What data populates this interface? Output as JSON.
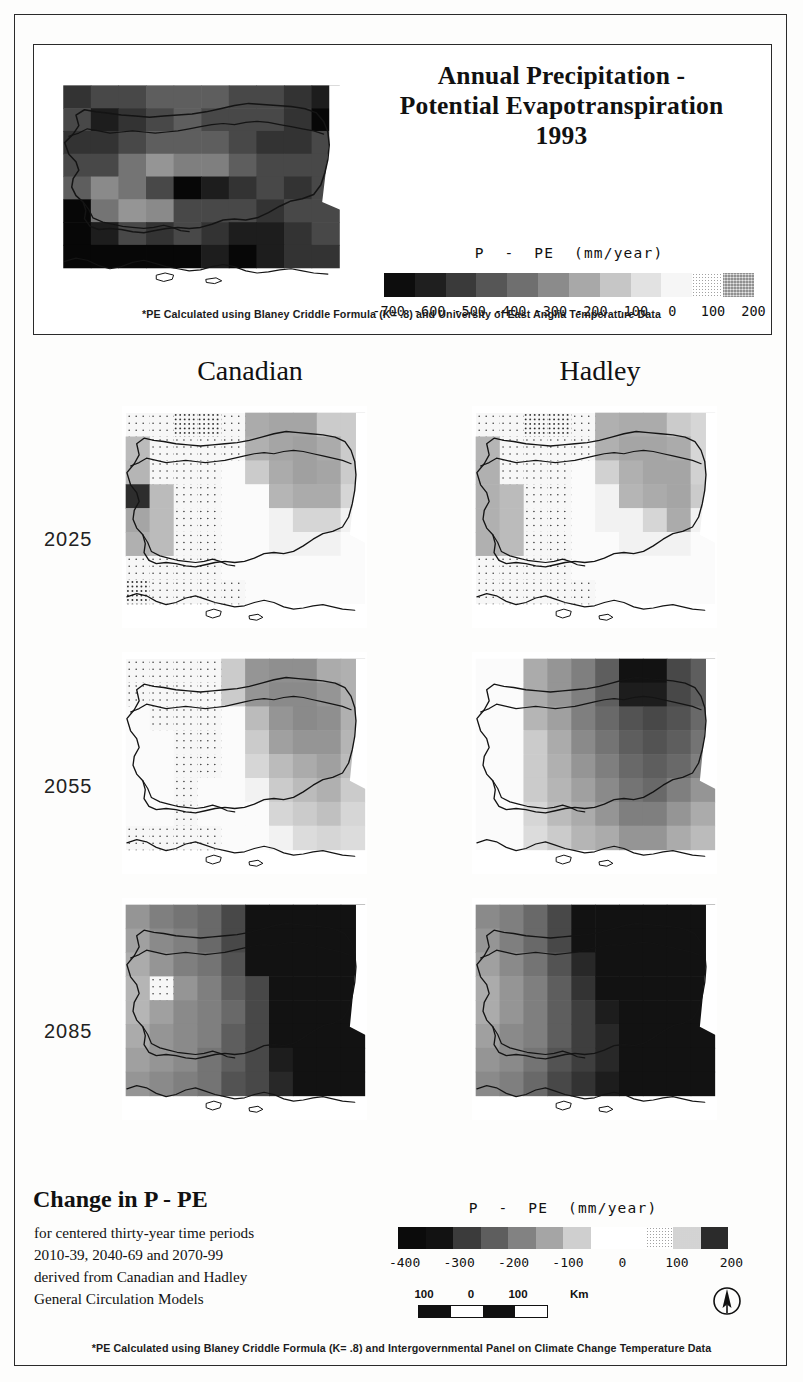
{
  "figure": {
    "title_lines": [
      "Annual Precipitation -",
      "Potential Evapotranspiration",
      "1993"
    ],
    "top_note": "*PE Calculated using Blaney Criddle Formula (K= .8) and University of East Anglia Temperature Data",
    "bottom_note": "*PE Calculated using Blaney Criddle Formula (K= .8) and Intergovernmental Panel on Climate Change Temperature Data",
    "region": "Bulgaria"
  },
  "legend_top": {
    "caption": "P  -  PE  (mm/year)",
    "ticks": [
      "-700",
      "-600",
      "-500",
      "-400",
      "-300",
      "-200",
      "-100",
      "0",
      "100",
      "200"
    ],
    "swatches": [
      "#0d0d0d",
      "#1f1f1f",
      "#3a3a3a",
      "#565656",
      "#6f6f6f",
      "#8b8b8b",
      "#a8a8a8",
      "#c6c6c6",
      "#e2e2e2",
      "#f6f6f6",
      "stipple-light",
      "stipple-dark"
    ]
  },
  "legend_bottom": {
    "caption": "P  -  PE  (mm/year)",
    "ticks": [
      "-400",
      "-300",
      "-200",
      "-100",
      "0",
      "100",
      "200"
    ],
    "swatches": [
      "#0b0b0b",
      "#121212",
      "#3b3b3b",
      "#5e5e5e",
      "#828282",
      "#a5a5a5",
      "#cfcfcf",
      "#ffffff",
      "#ffffff",
      "stipple-light",
      "stipple-mid",
      "#2b2b2b"
    ]
  },
  "matrix": {
    "columns": [
      "Canadian",
      "Hadley"
    ],
    "rows": [
      "2025",
      "2055",
      "2085"
    ]
  },
  "change_block": {
    "title": "Change in P - PE",
    "lines": [
      "for centered thirty-year time periods",
      "2010-39, 2040-69 and 2070-99",
      "derived from Canadian and Hadley",
      "General Circulation Models"
    ]
  },
  "scalebar": {
    "labels": [
      "100",
      "0",
      "100"
    ],
    "unit": "Km"
  },
  "chart_data": {
    "type": "heatmap",
    "variable": "P - PE",
    "units": "mm/year",
    "grid": {
      "cols": 10,
      "rows": 8
    },
    "panels": [
      {
        "name": "observed-1993",
        "label": "1993",
        "colorscale_ticks": [
          -700,
          -600,
          -500,
          -400,
          -300,
          -200,
          -100,
          0,
          100,
          200
        ],
        "values": [
          [
            -340,
            -300,
            -300,
            -260,
            -260,
            -260,
            -300,
            -300,
            -340,
            -380
          ],
          [
            -300,
            -380,
            -340,
            -300,
            -260,
            -300,
            -300,
            -300,
            -340,
            -420
          ],
          [
            -340,
            -340,
            -300,
            -260,
            -260,
            -260,
            -300,
            -340,
            -340,
            -300
          ],
          [
            -300,
            -300,
            -220,
            -160,
            -200,
            -200,
            -260,
            -300,
            -300,
            -300
          ],
          [
            -260,
            -180,
            -220,
            -300,
            -420,
            -380,
            -340,
            -300,
            -340,
            -300
          ],
          [
            -420,
            -220,
            -160,
            -180,
            -300,
            -300,
            -300,
            -340,
            -300,
            -300
          ],
          [
            -620,
            -380,
            -300,
            -340,
            -300,
            -340,
            -380,
            -380,
            -340,
            -300
          ],
          [
            -700,
            -620,
            -420,
            -660,
            -420,
            -380,
            -420,
            -380,
            -340,
            -340
          ]
        ]
      },
      {
        "name": "canadian-2025",
        "model": "Canadian",
        "period": "2010-39",
        "colorscale_ticks": [
          -400,
          -300,
          -200,
          -100,
          0,
          100,
          200
        ],
        "values": [
          [
            100,
            120,
            130,
            130,
            120,
            -120,
            -130,
            -130,
            -60,
            -60
          ],
          [
            -90,
            100,
            120,
            120,
            100,
            -110,
            -130,
            -140,
            -120,
            -60
          ],
          [
            -100,
            100,
            120,
            110,
            60,
            -60,
            -120,
            -140,
            -130,
            -60
          ],
          [
            -350,
            -90,
            110,
            100,
            60,
            30,
            -100,
            -120,
            -120,
            -40
          ],
          [
            -130,
            -90,
            110,
            100,
            60,
            30,
            20,
            -40,
            -40,
            20
          ],
          [
            -110,
            -90,
            110,
            100,
            60,
            30,
            20,
            20,
            20,
            30
          ],
          [
            120,
            110,
            120,
            110,
            60,
            40,
            30,
            30,
            40,
            40
          ],
          [
            130,
            120,
            120,
            110,
            80,
            60,
            40,
            40,
            40,
            40
          ]
        ]
      },
      {
        "name": "hadley-2025",
        "model": "Hadley",
        "period": "2010-39",
        "colorscale_ticks": [
          -400,
          -300,
          -200,
          -100,
          0,
          100,
          200
        ],
        "values": [
          [
            110,
            120,
            130,
            130,
            120,
            -110,
            -120,
            -120,
            -60,
            -40
          ],
          [
            -100,
            110,
            120,
            120,
            110,
            -110,
            -130,
            -130,
            -120,
            -40
          ],
          [
            -110,
            110,
            120,
            110,
            70,
            -50,
            -110,
            -130,
            -130,
            -50
          ],
          [
            -110,
            -90,
            110,
            100,
            60,
            20,
            -100,
            -120,
            -130,
            -60
          ],
          [
            -110,
            -90,
            110,
            100,
            60,
            20,
            20,
            -40,
            -120,
            20
          ],
          [
            -110,
            -90,
            110,
            100,
            60,
            30,
            20,
            20,
            20,
            30
          ],
          [
            110,
            110,
            120,
            110,
            60,
            40,
            30,
            30,
            40,
            40
          ],
          [
            120,
            120,
            120,
            110,
            80,
            60,
            40,
            40,
            40,
            40
          ]
        ]
      },
      {
        "name": "canadian-2055",
        "model": "Canadian",
        "period": "2040-69",
        "colorscale_ticks": [
          -400,
          -300,
          -200,
          -100,
          0,
          100,
          200
        ],
        "values": [
          [
            100,
            110,
            120,
            120,
            -60,
            -160,
            -170,
            -170,
            -120,
            -110
          ],
          [
            90,
            100,
            110,
            110,
            -60,
            -160,
            -180,
            -180,
            -160,
            -110
          ],
          [
            60,
            90,
            110,
            100,
            30,
            -90,
            -160,
            -180,
            -170,
            -110
          ],
          [
            40,
            60,
            100,
            90,
            30,
            -60,
            -140,
            -160,
            -160,
            -100
          ],
          [
            40,
            60,
            90,
            80,
            30,
            -40,
            -90,
            -120,
            -140,
            -90
          ],
          [
            40,
            60,
            80,
            70,
            30,
            20,
            -60,
            -90,
            -110,
            -60
          ],
          [
            60,
            70,
            80,
            70,
            40,
            30,
            -40,
            -60,
            -80,
            -40
          ],
          [
            80,
            80,
            90,
            80,
            50,
            40,
            20,
            -30,
            -40,
            -30
          ]
        ]
      },
      {
        "name": "hadley-2055",
        "model": "Hadley",
        "period": "2040-69",
        "colorscale_ticks": [
          -400,
          -300,
          -200,
          -100,
          0,
          100,
          200
        ],
        "values": [
          [
            60,
            60,
            -120,
            -160,
            -200,
            -260,
            -400,
            -400,
            -300,
            -260
          ],
          [
            40,
            40,
            -120,
            -160,
            -200,
            -260,
            -380,
            -380,
            -300,
            -260
          ],
          [
            40,
            40,
            -100,
            -140,
            -200,
            -240,
            -280,
            -300,
            -280,
            -240
          ],
          [
            40,
            40,
            -60,
            -120,
            -180,
            -220,
            -260,
            -280,
            -260,
            -220
          ],
          [
            40,
            40,
            -60,
            -110,
            -160,
            -200,
            -240,
            -260,
            -240,
            -200
          ],
          [
            40,
            30,
            -60,
            -100,
            -140,
            -180,
            -220,
            -240,
            -200,
            -160
          ],
          [
            30,
            30,
            -40,
            -90,
            -120,
            -160,
            -200,
            -200,
            -160,
            -120
          ],
          [
            30,
            30,
            -30,
            -60,
            -100,
            -120,
            -160,
            -160,
            -120,
            -90
          ]
        ]
      },
      {
        "name": "canadian-2085",
        "model": "Canadian",
        "period": "2070-99",
        "colorscale_ticks": [
          -400,
          -300,
          -200,
          -100,
          0,
          100,
          200
        ],
        "values": [
          [
            -160,
            -200,
            -220,
            -240,
            -300,
            -400,
            -400,
            -400,
            -400,
            -400
          ],
          [
            -140,
            -180,
            -200,
            -240,
            -300,
            -400,
            -400,
            -400,
            -400,
            -400
          ],
          [
            -120,
            -160,
            -200,
            -220,
            -280,
            -400,
            -400,
            -400,
            -400,
            -400
          ],
          [
            -100,
            120,
            -160,
            -200,
            -260,
            -300,
            -400,
            -400,
            -400,
            -400
          ],
          [
            -100,
            -140,
            -180,
            -200,
            -240,
            -300,
            -400,
            -400,
            -400,
            -400
          ],
          [
            -120,
            -160,
            -180,
            -200,
            -260,
            -300,
            -400,
            -400,
            -400,
            -400
          ],
          [
            -140,
            -160,
            -180,
            -220,
            -260,
            -300,
            -380,
            -400,
            -400,
            -400
          ],
          [
            -160,
            -180,
            -200,
            -220,
            -280,
            -300,
            -360,
            -400,
            -400,
            -400
          ]
        ]
      },
      {
        "name": "hadley-2085",
        "model": "Hadley",
        "period": "2070-99",
        "colorscale_ticks": [
          -400,
          -300,
          -200,
          -100,
          0,
          100,
          200
        ],
        "values": [
          [
            -180,
            -200,
            -240,
            -300,
            -400,
            -400,
            -400,
            -400,
            -400,
            -400
          ],
          [
            -160,
            -200,
            -240,
            -300,
            -400,
            -400,
            -400,
            -400,
            -400,
            -400
          ],
          [
            -140,
            -180,
            -220,
            -280,
            -360,
            -400,
            -400,
            -400,
            -400,
            -400
          ],
          [
            -120,
            -160,
            -200,
            -260,
            -340,
            -400,
            -400,
            -400,
            -400,
            -400
          ],
          [
            -120,
            -160,
            -200,
            -260,
            -320,
            -380,
            -400,
            -400,
            -400,
            -400
          ],
          [
            -140,
            -180,
            -200,
            -260,
            -320,
            -360,
            -400,
            -400,
            -400,
            -400
          ],
          [
            -160,
            -180,
            -220,
            -280,
            -320,
            -360,
            -400,
            -400,
            -400,
            -400
          ],
          [
            -180,
            -200,
            -240,
            -300,
            -340,
            -380,
            -400,
            -400,
            -400,
            -400
          ]
        ]
      }
    ]
  }
}
